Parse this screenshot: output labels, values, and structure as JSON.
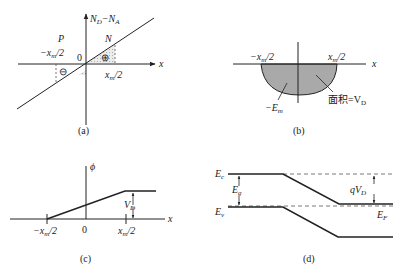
{
  "panels": {
    "a": {
      "caption": "(a)",
      "y_axis_label": "N",
      "y_sub1": "D",
      "y_minus": "−N",
      "y_sub2": "A",
      "x_axis_label": "x",
      "region_p": "P",
      "region_n": "N",
      "origin": "0",
      "left_bound": "−x",
      "left_bound_sub": "m",
      "left_bound_tail": "/2",
      "right_bound": "x",
      "right_bound_sub": "m",
      "right_bound_tail": "/2",
      "negative_charge": "⊖",
      "positive_charge": "⊕"
    },
    "b": {
      "caption": "(b)",
      "x_axis_label": "x",
      "left_bound": "−x",
      "left_bound_sub": "m",
      "left_bound_tail": "/2",
      "right_bound": "x",
      "right_bound_sub": "m",
      "right_bound_tail": "/2",
      "min_field": "−E",
      "min_field_sub": "m",
      "area_label": "面积=V",
      "area_sub": "D"
    },
    "c": {
      "caption": "(c)",
      "y_axis_label": "ϕ",
      "x_axis_label": "x",
      "origin": "0",
      "left_bound": "−x",
      "left_bound_sub": "m",
      "left_bound_tail": "/2",
      "right_bound": "x",
      "right_bound_sub": "m",
      "right_bound_tail": "/2",
      "built_in": "V",
      "built_in_sub": "D"
    },
    "d": {
      "caption": "(d)",
      "ec": "E",
      "ec_sub": "c",
      "ev": "E",
      "ev_sub": "v",
      "eg": "E",
      "eg_sub": "g",
      "ef": "E",
      "ef_sub": "F",
      "qvd": "qV",
      "qvd_sub": "D"
    }
  },
  "colors": {
    "line": "#222222",
    "fill": "#a9a9a9",
    "shade": "#d8d8d8",
    "dash": "#555555"
  }
}
